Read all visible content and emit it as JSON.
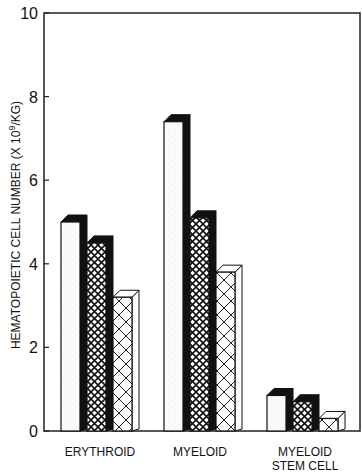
{
  "chart_data": {
    "type": "bar",
    "title": "",
    "xlabel": "",
    "ylabel": "HEMATOPOIETIC CELL NUMBER (X 10^9/KG)",
    "ylabel_parts": {
      "main": "HEMATOPOIETIC CELL NUMBER (X 10",
      "sup": "9",
      "tail": "/KG)"
    },
    "ylim": [
      0,
      10
    ],
    "yticks": [
      "0",
      "2",
      "4",
      "6",
      "8",
      "10"
    ],
    "categories": [
      "ERYTHROID",
      "MYELOID",
      "MYELOID STEM CELL"
    ],
    "category_labels": [
      [
        "ERYTHROID"
      ],
      [
        "MYELOID"
      ],
      [
        "MYELOID",
        "STEM CELL"
      ]
    ],
    "series": [
      {
        "name": "Series 1 (stippled, black 3D side)",
        "values": [
          5.0,
          7.4,
          0.85
        ]
      },
      {
        "name": "Series 2 (fine crosshatch, black 3D side)",
        "values": [
          4.5,
          5.1,
          0.7
        ]
      },
      {
        "name": "Series 3 (coarse crosshatch, white 3D side)",
        "values": [
          3.2,
          3.8,
          0.3
        ]
      }
    ],
    "grid": false,
    "legend": "none",
    "style": "3D bars"
  }
}
